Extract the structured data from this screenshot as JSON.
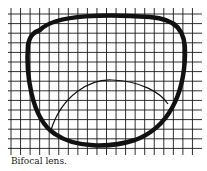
{
  "figure": {
    "caption": "Bifocal lens.",
    "colors": {
      "grid": "#1a1a1a",
      "lens_outline": "#111111",
      "background": "#ffffff"
    }
  }
}
